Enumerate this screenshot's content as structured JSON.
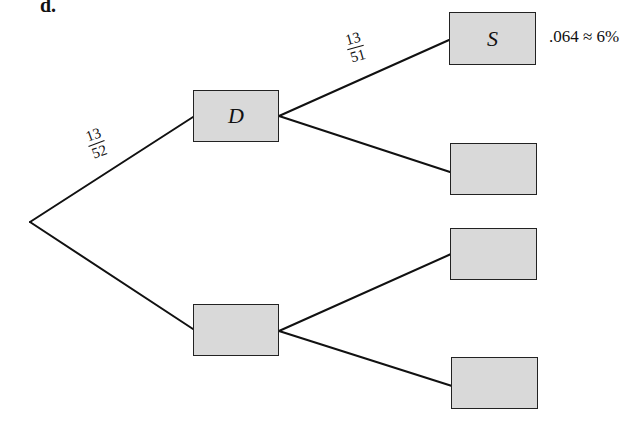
{
  "part_label": "d.",
  "tree": {
    "root": {
      "x": 30,
      "y": 222
    },
    "nodes": [
      {
        "id": "D",
        "label": "D",
        "x": 193,
        "y": 90,
        "w": 86,
        "h": 52
      },
      {
        "id": "notD",
        "label": "",
        "x": 193,
        "y": 304,
        "w": 86,
        "h": 52
      },
      {
        "id": "S",
        "label": "S",
        "x": 449,
        "y": 12,
        "w": 87,
        "h": 53
      },
      {
        "id": "D_other",
        "label": "",
        "x": 450,
        "y": 143,
        "w": 87,
        "h": 52
      },
      {
        "id": "notD_top",
        "label": "",
        "x": 450,
        "y": 228,
        "w": 87,
        "h": 52
      },
      {
        "id": "notD_bottom",
        "label": "",
        "x": 451,
        "y": 357,
        "w": 87,
        "h": 52
      }
    ],
    "branches": [
      {
        "from": [
          30,
          222
        ],
        "to": [
          193,
          117
        ]
      },
      {
        "from": [
          30,
          222
        ],
        "to": [
          193,
          329
        ]
      },
      {
        "from": [
          279,
          116
        ],
        "to": [
          449,
          40
        ]
      },
      {
        "from": [
          279,
          116
        ],
        "to": [
          450,
          172
        ]
      },
      {
        "from": [
          279,
          331
        ],
        "to": [
          451,
          254
        ]
      },
      {
        "from": [
          279,
          331
        ],
        "to": [
          452,
          386
        ]
      }
    ],
    "branch_labels": [
      {
        "numerator": "13",
        "denominator": "52",
        "x": 88,
        "y": 127,
        "rotate": -20
      },
      {
        "numerator": "13",
        "denominator": "51",
        "x": 347,
        "y": 31,
        "rotate": -16
      }
    ],
    "result": {
      "text": ".064 ≈ 6%",
      "x": 549,
      "y": 27
    }
  }
}
